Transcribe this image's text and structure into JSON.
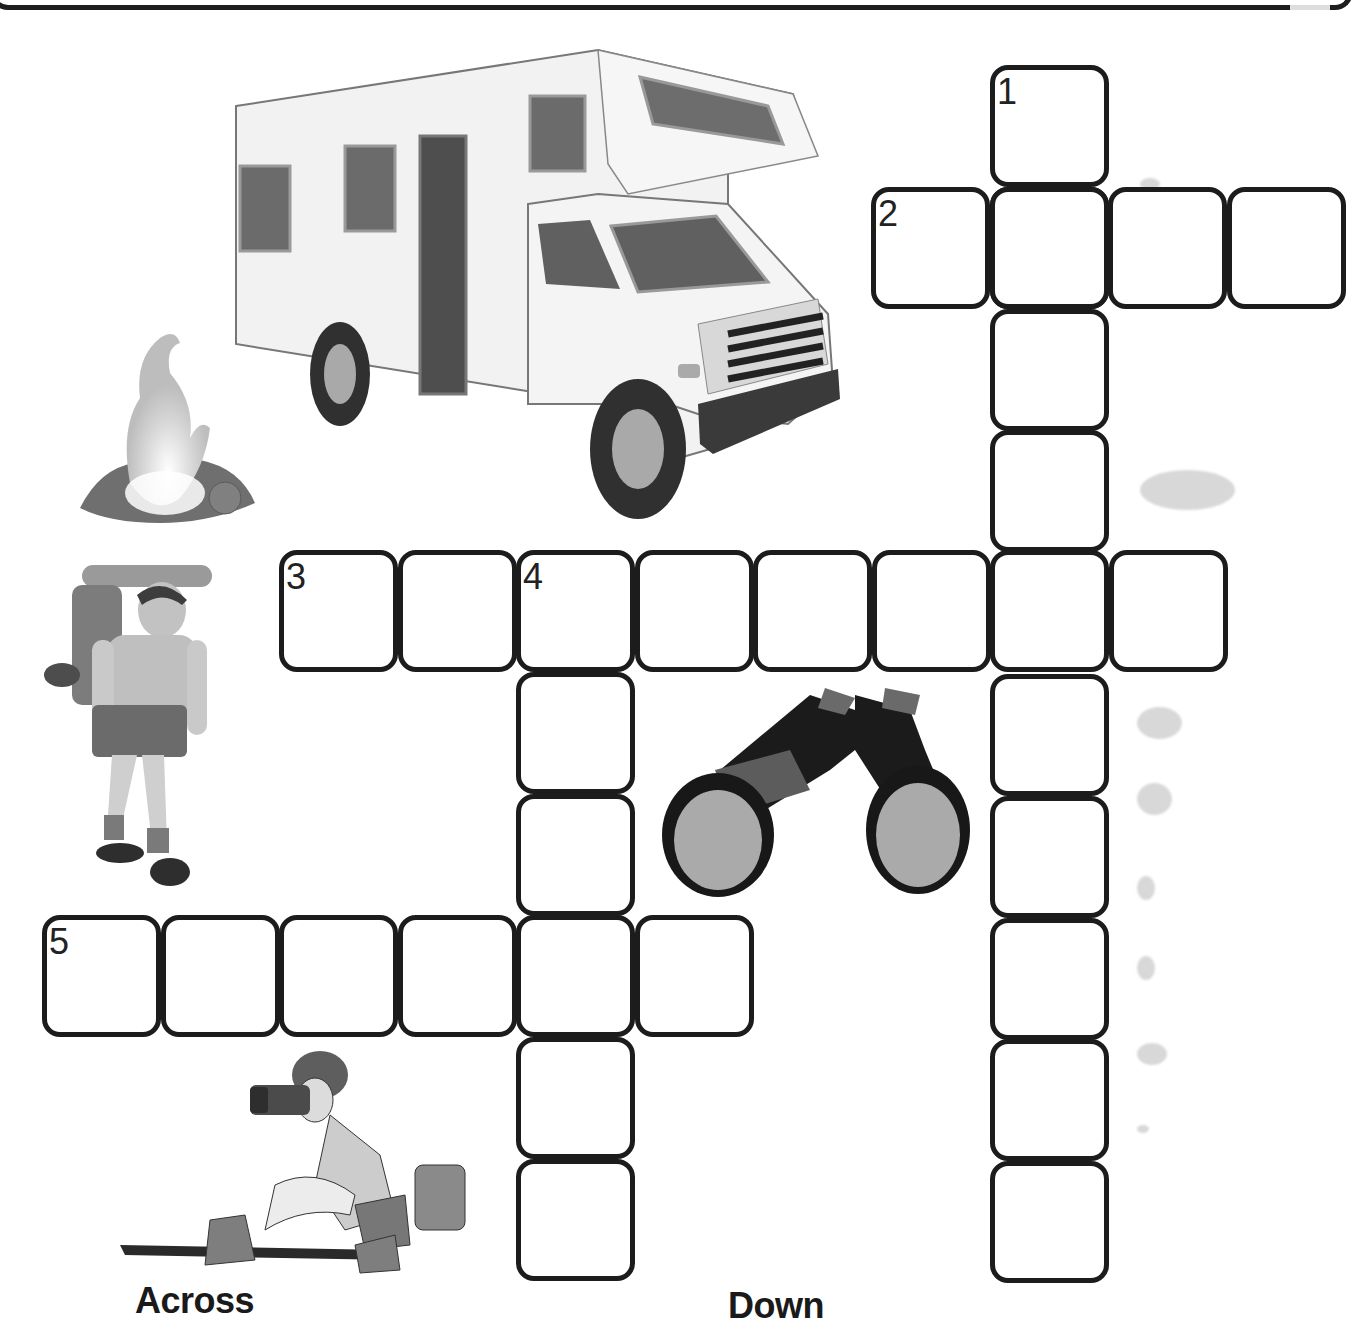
{
  "puzzle": {
    "theme": "camping-outdoors",
    "cell_size": {
      "w": 119,
      "h": 122
    },
    "clues": {
      "across": [
        {
          "number": 1,
          "label": "2",
          "direction": "across",
          "length": 4,
          "start": {
            "x": 871,
            "y": 187
          }
        },
        {
          "number": 3,
          "label": "3",
          "direction": "across",
          "length": 8,
          "start": {
            "x": 279,
            "y": 550
          }
        },
        {
          "number": 5,
          "label": "5",
          "direction": "across",
          "length": 6,
          "start": {
            "x": 42,
            "y": 915
          }
        }
      ],
      "down": [
        {
          "number": 1,
          "label": "1",
          "direction": "down",
          "length": 10,
          "start": {
            "x": 990,
            "y": 65
          }
        },
        {
          "number": 4,
          "label": "4",
          "direction": "down",
          "length": 6,
          "start": {
            "x": 516,
            "y": 550
          }
        }
      ]
    },
    "headings": {
      "across": "Across",
      "down": "Down"
    }
  },
  "illustrations": [
    {
      "name": "rv-motorhome-illustration",
      "desc": "RV camper van"
    },
    {
      "name": "campfire-illustration",
      "desc": "campfire"
    },
    {
      "name": "backpacker-illustration",
      "desc": "hiker with backpack"
    },
    {
      "name": "binoculars-illustration",
      "desc": "binoculars"
    },
    {
      "name": "photographer-illustration",
      "desc": "woman crouching with camera"
    }
  ],
  "colors": {
    "cell_border": "#1c1c1c",
    "cell_fill": "#ffffff",
    "text": "#1a1a1a",
    "art_gray": "#7a7a7a"
  }
}
